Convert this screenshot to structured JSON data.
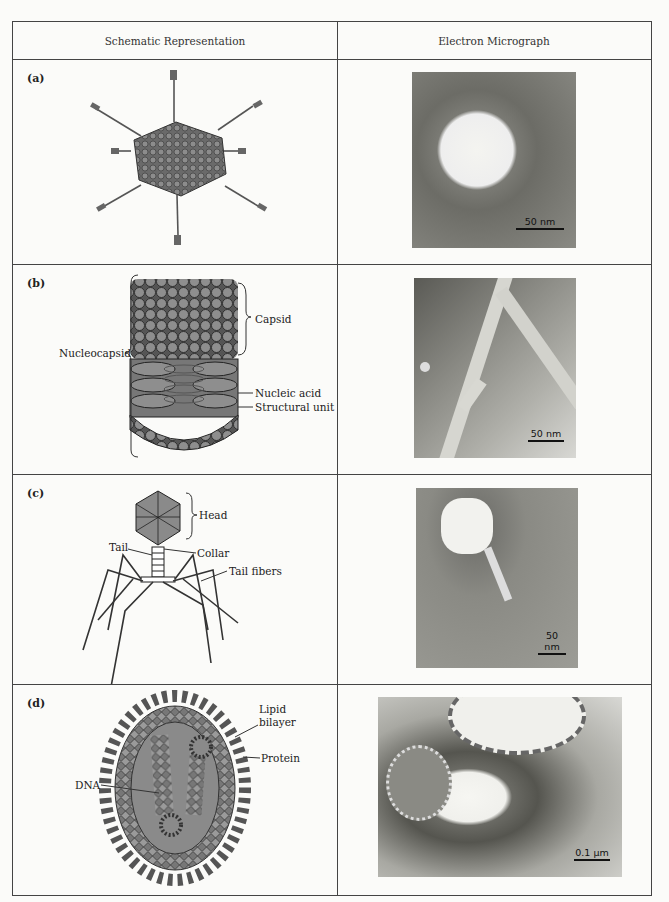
{
  "table": {
    "headers": [
      "Schematic Representation",
      "Electron Micrograph"
    ],
    "rows": [
      {
        "panel": "(a)",
        "schematic": {
          "subject": "icosahedral-virus-with-spikes",
          "labels": []
        },
        "micrograph": {
          "subject": "icosahedral virus particle",
          "scale_bar": "50 nm"
        }
      },
      {
        "panel": "(b)",
        "schematic": {
          "subject": "helical-rod-virus",
          "labels": [
            "Capsid",
            "Nucleocapsid",
            "Nucleic acid",
            "Structural unit"
          ]
        },
        "micrograph": {
          "subject": "rod-shaped virus particles",
          "scale_bar": "50 nm"
        }
      },
      {
        "panel": "(c)",
        "schematic": {
          "subject": "bacteriophage",
          "labels": [
            "Head",
            "Tail",
            "Collar",
            "Tail fibers"
          ]
        },
        "micrograph": {
          "subject": "bacteriophage particle",
          "scale_bar": "50 nm"
        }
      },
      {
        "panel": "(d)",
        "schematic": {
          "subject": "enveloped-virus",
          "labels": [
            "Lipid bilayer",
            "Protein",
            "DNA"
          ]
        },
        "micrograph": {
          "subject": "enveloped virus particles",
          "scale_bar": "0.1 μm"
        }
      }
    ]
  },
  "labels": {
    "b": {
      "capsid": "Capsid",
      "nucleocapsid": "Nucleocapsid",
      "nucleic_acid": "Nucleic acid",
      "structural_unit": "Structural unit"
    },
    "c": {
      "head": "Head",
      "tail": "Tail",
      "collar": "Collar",
      "tail_fibers": "Tail fibers"
    },
    "d": {
      "lipid": "Lipid",
      "bilayer": "bilayer",
      "protein": "Protein",
      "dna": "DNA"
    }
  },
  "colors": {
    "line": "#444444",
    "schematic_fill": "#8a8a8a",
    "background": "#fbfbf9"
  }
}
